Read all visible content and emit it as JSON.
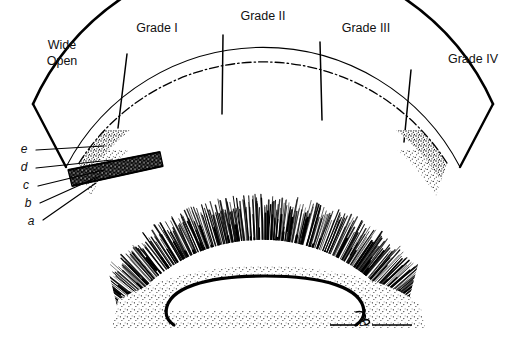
{
  "figure": {
    "title_visible": false,
    "background_color": "#ffffff",
    "ink_color": "#000000",
    "type": "anatomical-line-drawing",
    "description_kind": "fan-shaped graded cross-section"
  },
  "grades": [
    {
      "id": "wide-open",
      "label_line1": "Wide",
      "label_line2": "Open",
      "label": "Wide Open",
      "x": 62,
      "y": 46
    },
    {
      "id": "grade-1",
      "label": "Grade I",
      "x": 157,
      "y": 29
    },
    {
      "id": "grade-2",
      "label": "Grade II",
      "x": 263,
      "y": 17
    },
    {
      "id": "grade-3",
      "label": "Grade III",
      "x": 366,
      "y": 29
    },
    {
      "id": "grade-4",
      "label": "Grade IV",
      "x": 473,
      "y": 60
    }
  ],
  "layer_labels": [
    {
      "id": "e",
      "label": "e",
      "x": 24,
      "y": 150
    },
    {
      "id": "d",
      "label": "d",
      "x": 24,
      "y": 168
    },
    {
      "id": "c",
      "label": "c",
      "x": 26,
      "y": 186
    },
    {
      "id": "b",
      "label": "b",
      "x": 28,
      "y": 204
    },
    {
      "id": "a",
      "label": "a",
      "x": 31,
      "y": 222
    }
  ],
  "leaders": [
    {
      "id": "leader-e",
      "x1": 36,
      "y1": 150,
      "x2": 104,
      "y2": 146
    },
    {
      "id": "leader-d",
      "x1": 36,
      "y1": 168,
      "x2": 112,
      "y2": 160
    },
    {
      "id": "leader-c",
      "x1": 38,
      "y1": 186,
      "x2": 104,
      "y2": 170
    },
    {
      "id": "leader-b",
      "x1": 40,
      "y1": 203,
      "x2": 100,
      "y2": 176
    },
    {
      "id": "leader-a",
      "x1": 43,
      "y1": 220,
      "x2": 96,
      "y2": 183
    }
  ],
  "signature": {
    "text": "B.",
    "x": 364,
    "y": 326
  }
}
